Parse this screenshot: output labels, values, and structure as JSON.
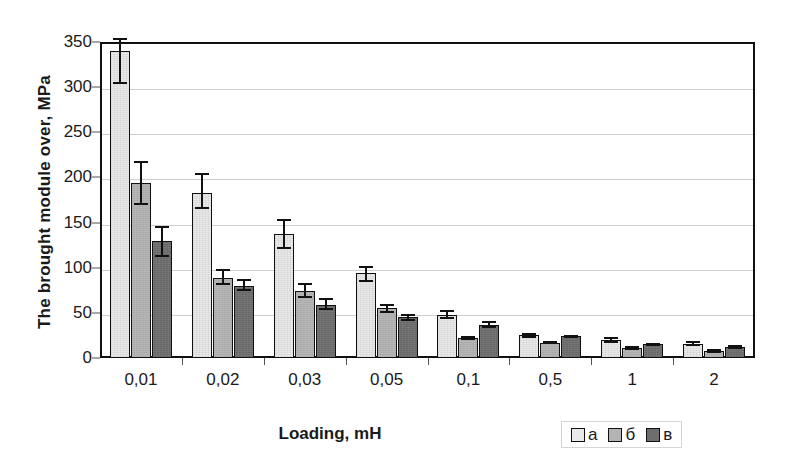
{
  "chart_data": {
    "type": "bar",
    "title": "",
    "xlabel": "Loading, mH",
    "ylabel": "The brought module over, MPa",
    "categories": [
      "0,01",
      "0,02",
      "0,03",
      "0,05",
      "0,1",
      "0,5",
      "1",
      "2"
    ],
    "ylim": [
      0,
      350
    ],
    "yticks": [
      0,
      50,
      100,
      150,
      200,
      250,
      300,
      350
    ],
    "ytick_labels": [
      "0",
      "50",
      "100",
      "150",
      "200",
      "250",
      "300",
      "350"
    ],
    "grid": true,
    "legend_position": "bottom-right",
    "error_bars": true,
    "series": [
      {
        "name": "а",
        "color": "#e9e9e9",
        "values": [
          340,
          183,
          137,
          94,
          48,
          25,
          20,
          16
        ],
        "err_low": [
          36,
          18,
          16,
          10,
          5,
          3,
          3,
          3
        ],
        "err_high": [
          15,
          22,
          17,
          8,
          5,
          3,
          3,
          3
        ]
      },
      {
        "name": "б",
        "color": "#b4b4b4",
        "values": [
          194,
          89,
          74,
          55,
          22,
          17,
          11,
          8
        ],
        "err_low": [
          24,
          8,
          8,
          5,
          2,
          2,
          2,
          2
        ],
        "err_high": [
          24,
          10,
          9,
          5,
          2,
          2,
          2,
          2
        ]
      },
      {
        "name": "в",
        "color": "#6e6e6e",
        "values": [
          130,
          80,
          59,
          45,
          37,
          24,
          15,
          12
        ],
        "err_low": [
          18,
          6,
          6,
          4,
          4,
          2,
          2,
          2
        ],
        "err_high": [
          16,
          7,
          7,
          4,
          4,
          2,
          2,
          2
        ]
      }
    ]
  },
  "axes": {
    "y_title": "The brought module over, MPa",
    "x_title": "Loading, mH"
  },
  "legend": {
    "entries": [
      {
        "label": "а",
        "swatch": "series-a"
      },
      {
        "label": "б",
        "swatch": "series-b"
      },
      {
        "label": "в",
        "swatch": "series-c"
      }
    ]
  }
}
